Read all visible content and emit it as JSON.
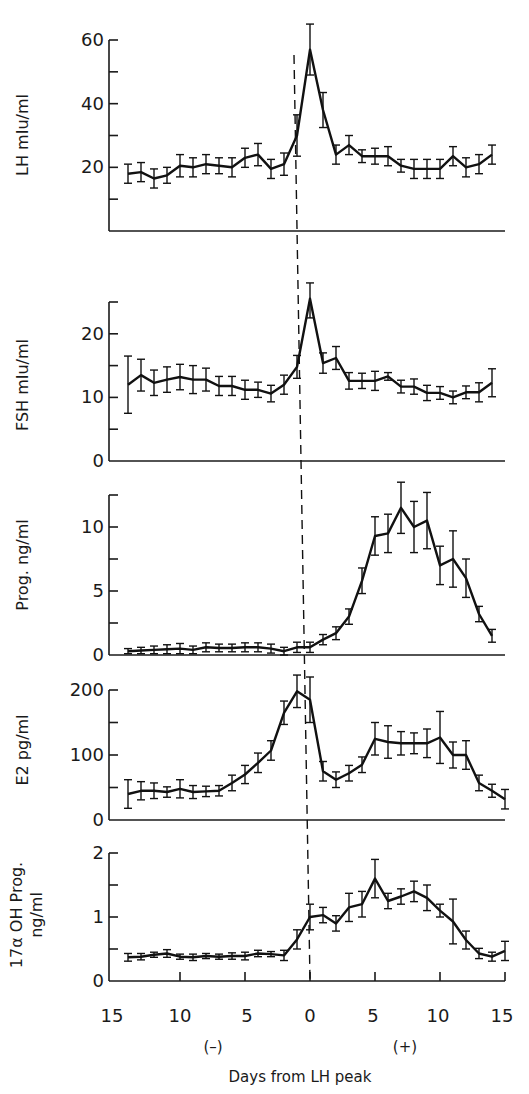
{
  "figure": {
    "xlabel": "Days from LH peak",
    "xsign_negative": "(–)",
    "xsign_positive": "(+)",
    "xticks": [
      "15",
      "10",
      "5",
      "0",
      "5",
      "10",
      "15"
    ]
  },
  "chart_data": [
    {
      "type": "line",
      "title": "LH",
      "ylabel": "LH mIu/ml",
      "xlabel": "Days from LH peak",
      "ylim": [
        0,
        60
      ],
      "yticks_labeled": [
        20,
        40,
        60
      ],
      "yticks_minor": [
        10,
        30,
        50
      ],
      "x": [
        -14,
        -13,
        -12,
        -11,
        -10,
        -9,
        -8,
        -7,
        -6,
        -5,
        -4,
        -3,
        -2,
        -1,
        0,
        1,
        2,
        3,
        4,
        5,
        6,
        7,
        8,
        9,
        10,
        11,
        12,
        13,
        14
      ],
      "values": [
        18,
        18.5,
        16.5,
        17.5,
        20.5,
        20,
        21,
        20.5,
        20,
        23,
        24,
        19.5,
        21,
        30,
        57,
        38,
        24,
        27,
        23.5,
        23.5,
        23.5,
        20.5,
        19.5,
        19.5,
        19.5,
        23.5,
        20,
        21,
        24
      ],
      "errors": [
        3,
        3,
        3,
        2.5,
        3.5,
        3,
        3,
        2.5,
        3,
        3,
        3.5,
        3,
        3.5,
        6.5,
        8,
        5.5,
        3,
        3,
        2,
        2.5,
        3,
        2,
        3,
        3,
        3,
        3,
        3,
        3,
        3
      ]
    },
    {
      "type": "line",
      "title": "FSH",
      "ylabel": "FSH mIu/ml",
      "xlabel": "Days from LH peak",
      "ylim": [
        0,
        25
      ],
      "yticks_labeled": [
        0,
        10,
        20
      ],
      "yticks_minor": [
        5,
        15,
        25
      ],
      "x": [
        -14,
        -13,
        -12,
        -11,
        -10,
        -9,
        -8,
        -7,
        -6,
        -5,
        -4,
        -3,
        -2,
        -1,
        0,
        1,
        2,
        3,
        4,
        5,
        6,
        7,
        8,
        9,
        10,
        11,
        12,
        13,
        14
      ],
      "values": [
        12,
        13.5,
        12.3,
        12.8,
        13.2,
        12.8,
        12.8,
        11.8,
        11.8,
        11.2,
        11.2,
        10.6,
        12,
        14.8,
        25.5,
        15.4,
        16.2,
        12.6,
        12.6,
        12.6,
        13.3,
        11.7,
        11.7,
        10.7,
        10.7,
        10,
        10.8,
        10.8,
        12.3
      ],
      "errors": [
        4.5,
        2.5,
        2,
        2,
        2,
        2.2,
        1.8,
        1.5,
        1.5,
        1.5,
        1.2,
        1.3,
        1.5,
        1.8,
        3,
        1.6,
        1.8,
        1.3,
        1.2,
        1.5,
        0.6,
        1,
        1.2,
        1.2,
        1,
        1,
        1,
        1.5,
        2.2
      ]
    },
    {
      "type": "line",
      "title": "Progesterone",
      "ylabel": "Prog. ng/ml",
      "xlabel": "Days from LH peak",
      "ylim": [
        0,
        12.5
      ],
      "yticks_labeled": [
        0,
        5,
        10
      ],
      "yticks_minor": [
        2.5,
        7.5,
        12.5
      ],
      "x": [
        -14,
        -13,
        -12,
        -11,
        -10,
        -9,
        -8,
        -7,
        -6,
        -5,
        -4,
        -3,
        -2,
        -1,
        0,
        1,
        2,
        3,
        4,
        5,
        6,
        7,
        8,
        9,
        10,
        11,
        12,
        13,
        14
      ],
      "values": [
        0.3,
        0.35,
        0.4,
        0.45,
        0.5,
        0.4,
        0.6,
        0.55,
        0.55,
        0.6,
        0.6,
        0.5,
        0.3,
        0.6,
        0.6,
        1.2,
        1.7,
        3,
        5.8,
        9.3,
        9.5,
        11.5,
        10,
        10.5,
        7,
        7.5,
        6,
        3.2,
        1.5
      ],
      "errors": [
        0.2,
        0.25,
        0.3,
        0.35,
        0.4,
        0.3,
        0.35,
        0.3,
        0.3,
        0.35,
        0.35,
        0.35,
        0.3,
        0.4,
        0.4,
        0.4,
        0.5,
        0.6,
        1,
        1.5,
        1.5,
        2,
        2,
        2.2,
        1.5,
        2.2,
        1.5,
        0.6,
        0.5
      ]
    },
    {
      "type": "line",
      "title": "Estradiol",
      "ylabel": "E2 pg/ml",
      "xlabel": "Days from LH peak",
      "ylim": [
        0,
        200
      ],
      "yticks_labeled": [
        0,
        100,
        200
      ],
      "yticks_minor": [
        50,
        150
      ],
      "x": [
        -14,
        -13,
        -12,
        -11,
        -10,
        -9,
        -8,
        -7,
        -6,
        -5,
        -4,
        -3,
        -2,
        -1,
        0,
        1,
        2,
        3,
        4,
        5,
        6,
        7,
        8,
        9,
        10,
        11,
        12,
        13,
        14
      ],
      "values": [
        40,
        45,
        45,
        43,
        48,
        43,
        44,
        45,
        57,
        70,
        88,
        107,
        165,
        198,
        185,
        75,
        62,
        72,
        85,
        125,
        120,
        118,
        118,
        118,
        127,
        100,
        100,
        57,
        45,
        32
      ],
      "errors": [
        22,
        14,
        12,
        8,
        14,
        10,
        8,
        8,
        12,
        14,
        15,
        15,
        18,
        25,
        35,
        15,
        12,
        12,
        12,
        25,
        25,
        18,
        16,
        22,
        40,
        20,
        22,
        12,
        10,
        15
      ]
    },
    {
      "type": "line",
      "title": "17α OH Progesterone",
      "ylabel": "17α OH Prog. ng/ml",
      "xlabel": "Days from LH peak",
      "ylim": [
        0,
        2
      ],
      "yticks_labeled": [
        0,
        1,
        2
      ],
      "yticks_minor": [
        0.5,
        1.5
      ],
      "x": [
        -14,
        -13,
        -12,
        -11,
        -10,
        -9,
        -8,
        -7,
        -6,
        -5,
        -4,
        -3,
        -2,
        -1,
        0,
        1,
        2,
        3,
        4,
        5,
        6,
        7,
        8,
        9,
        10,
        11,
        12,
        13,
        14
      ],
      "values": [
        0.37,
        0.38,
        0.41,
        0.43,
        0.38,
        0.37,
        0.39,
        0.38,
        0.39,
        0.39,
        0.43,
        0.42,
        0.4,
        0.65,
        1.0,
        1.03,
        0.9,
        1.15,
        1.2,
        1.6,
        1.25,
        1.32,
        1.4,
        1.3,
        1.1,
        0.93,
        0.64,
        0.43,
        0.38,
        0.47
      ],
      "errors": [
        0.06,
        0.05,
        0.04,
        0.06,
        0.04,
        0.05,
        0.04,
        0.04,
        0.05,
        0.06,
        0.05,
        0.04,
        0.08,
        0.15,
        0.2,
        0.12,
        0.12,
        0.22,
        0.2,
        0.3,
        0.12,
        0.12,
        0.16,
        0.2,
        0.1,
        0.35,
        0.14,
        0.08,
        0.07,
        0.15
      ]
    }
  ]
}
